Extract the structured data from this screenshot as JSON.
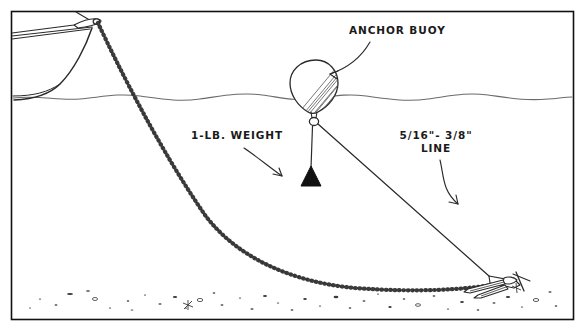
{
  "diagram": {
    "border_color": "#111111",
    "ink_color": "#1a1a1a",
    "water_color": "#555555",
    "background_color": "#ffffff"
  },
  "labels": {
    "anchor_buoy": {
      "text": "ANCHOR BUOY",
      "name": "anchor-buoy-label"
    },
    "weight": {
      "text": "1-LB. WEIGHT",
      "name": "weight-label"
    },
    "line_spec": {
      "line1": "5/16\"- 3/8\"",
      "line2": "LINE",
      "name": "line-spec-label"
    }
  },
  "elements": {
    "boat": "boat-bow",
    "chain": "anchor-chain",
    "anchor": "danforth-anchor",
    "buoy": "anchor-buoy",
    "weight": "cone-weight",
    "buoy_line": "buoy-retrieval-line",
    "waterline": "water-surface",
    "seabed": "seabed-pebbles"
  }
}
